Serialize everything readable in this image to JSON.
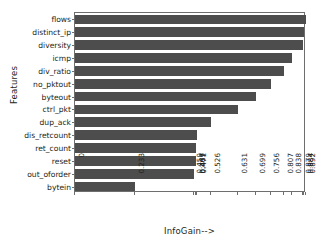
{
  "chart_data": {
    "type": "bar",
    "orientation": "horizontal",
    "title": "",
    "xlabel": "InfoGain-->",
    "ylabel": "Features",
    "grid": false,
    "legend": null,
    "categories": [
      "flows",
      "distinct_ip",
      "diversity",
      "icmp",
      "div_ratio",
      "no_pktout",
      "byteout",
      "ctrl_pkt",
      "dup_ack",
      "dis_retcount",
      "ret_count",
      "reset",
      "out_oforder",
      "bytein"
    ],
    "values": [
      0.892,
      0.884,
      0.879,
      0.838,
      0.807,
      0.756,
      0.699,
      0.631,
      0.526,
      0.471,
      0.469,
      0.467,
      0.459,
      0.233
    ],
    "xticklabels": [
      "0",
      "0.233",
      "0.459",
      "0.467",
      "0.469",
      "0.471",
      "0.526",
      "0.631",
      "0.699",
      "0.756",
      "0.807",
      "0.838",
      "0.879",
      "0.884",
      "0.892"
    ],
    "xlim": [
      0,
      0.892
    ],
    "bar_color": "#4d4d4d",
    "axis_color": "#6e6e6e",
    "background_color": "#ffffff"
  }
}
